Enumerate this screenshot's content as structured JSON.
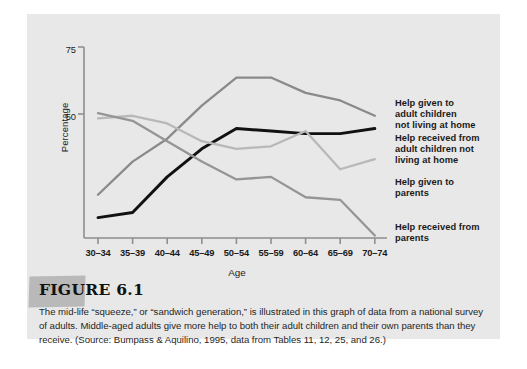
{
  "figure": {
    "heading": "FIGURE 6.1",
    "caption": "The mid-life “squeeze,” or “sandwich generation,” is illustrated in this graph of data from a national survey of adults. Middle-aged adults give more help to both their adult children and their own parents than they receive. (Source: Bumpass & Aquilino, 1995, data from Tables 11, 12, 25, and 26.)"
  },
  "colors": {
    "panel_background": "#e8e8e8",
    "axis": "#8e8e8e",
    "series_help_given_children": "#8a8a8a",
    "series_help_received_children": "#111111",
    "series_help_given_parents": "#b8b8b8",
    "series_help_received_parents": "#959595",
    "text": "#1a1a1a"
  },
  "chart_data": {
    "type": "line",
    "title": "",
    "xlabel": "Age",
    "ylabel": "Percentage",
    "categories": [
      "30–34",
      "35–39",
      "40–44",
      "45–49",
      "50–54",
      "55–59",
      "60–64",
      "65–69",
      "70–74"
    ],
    "ylim": [
      0,
      75
    ],
    "yticks": [
      50,
      75
    ],
    "ytick_labels": [
      "50",
      "75"
    ],
    "grid": false,
    "legend_position": "right",
    "series": [
      {
        "name": "Help given to adult children not living at home",
        "color": "#8a8a8a",
        "values": [
          17,
          30,
          39,
          52,
          63,
          63,
          57,
          54,
          48
        ]
      },
      {
        "name": "Help received from adult children not living at home",
        "color": "#111111",
        "values": [
          8,
          10,
          24,
          35,
          43,
          42,
          41,
          41,
          43
        ]
      },
      {
        "name": "Help given to parents",
        "color": "#b8b8b8",
        "values": [
          47,
          48,
          45,
          38,
          35,
          36,
          42,
          27,
          31
        ]
      },
      {
        "name": "Help received from parents",
        "color": "#959595",
        "values": [
          49,
          46,
          38,
          30,
          23,
          24,
          16,
          15,
          1
        ]
      }
    ]
  },
  "legend": [
    {
      "label_line1": "Help given to",
      "label_line2": "adult children",
      "label_line3": "not living at home"
    },
    {
      "label_line1": "Help received from",
      "label_line2": "adult children not",
      "label_line3": "living at home"
    },
    {
      "label_line1": "Help given to",
      "label_line2": "parents",
      "label_line3": ""
    },
    {
      "label_line1": "Help received from",
      "label_line2": "parents",
      "label_line3": ""
    }
  ]
}
